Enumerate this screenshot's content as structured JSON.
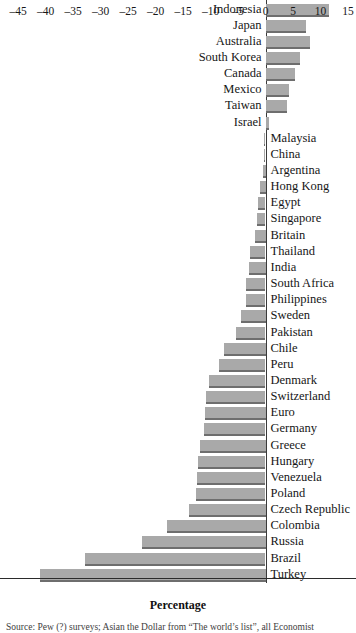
{
  "chart_data": {
    "type": "bar",
    "orientation": "horizontal",
    "title": "",
    "subtitle": "",
    "xlabel": "Percentage",
    "ylabel": "",
    "xlim": [
      -45,
      15
    ],
    "xticks": [
      -45,
      -40,
      -35,
      -30,
      -25,
      -20,
      -15,
      -10,
      -5,
      0,
      5,
      10,
      15
    ],
    "xticklabels": [
      "–45",
      "–40",
      "–35",
      "–30",
      "–25",
      "–20",
      "–15",
      "–10",
      "–5",
      "0",
      "5",
      "10",
      "15"
    ],
    "grid": false,
    "legend": null,
    "legend_position": "none",
    "categories": [
      "Indonesia",
      "Japan",
      "Australia",
      "South Korea",
      "Canada",
      "Mexico",
      "Taiwan",
      "Israel",
      "Malaysia",
      "China",
      "Argentina",
      "Hong Kong",
      "Egypt",
      "Singapore",
      "Britain",
      "Thailand",
      "India",
      "South Africa",
      "Philippines",
      "Sweden",
      "Pakistan",
      "Chile",
      "Peru",
      "Denmark",
      "Switzerland",
      "Euro",
      "Germany",
      "Greece",
      "Hungary",
      "Venezuela",
      "Poland",
      "Czech Republic",
      "Colombia",
      "Russia",
      "Brazil",
      "Turkey"
    ],
    "values": [
      11.5,
      7.3,
      8.0,
      6.2,
      5.3,
      4.2,
      3.9,
      0.6,
      -0.2,
      -0.3,
      -0.5,
      -1.0,
      -1.4,
      -1.6,
      -2.0,
      -2.8,
      -3.0,
      -3.6,
      -3.6,
      -4.5,
      -5.4,
      -7.5,
      -8.4,
      -10.2,
      -10.8,
      -11.0,
      -11.2,
      -12.0,
      -12.2,
      -12.4,
      -12.6,
      -14.0,
      -18.0,
      -22.5,
      -32.8,
      -41.0
    ],
    "bar_color": "#a9a9a9",
    "bar_edge_color": "#6e6e6e",
    "axis_color": "#2b2b2b",
    "zero_line": 0
  },
  "axis": {
    "x_title": "Percentage"
  },
  "source": {
    "note": "Source: Pew (?) surveys; Asian the Dollar from “The world’s list”, all Economist"
  }
}
